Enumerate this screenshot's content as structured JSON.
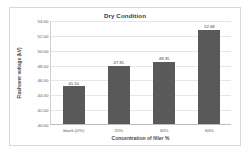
{
  "chart_data": {
    "type": "bar",
    "title": "Dry Condition",
    "xlabel": "Concentration of filler %",
    "ylabel": "Flashover voltage (kV)",
    "categories": [
      "blank (0%)",
      "20%",
      "40%",
      "60%"
    ],
    "values": [
      45.1,
      47.81,
      48.35,
      52.68
    ],
    "value_labels": [
      "45.10",
      "47.81",
      "48.35",
      "52.68"
    ],
    "ylim": [
      40.0,
      54.0
    ],
    "ytick_labels": [
      "54.00",
      "52.00",
      "50.00",
      "48.00",
      "46.00",
      "44.00",
      "42.00",
      "40.00"
    ],
    "yticks": [
      54.0,
      52.0,
      50.0,
      48.0,
      46.0,
      44.0,
      42.0,
      40.0
    ],
    "grid": true,
    "legend": false,
    "series": [
      {
        "name": "Flashover voltage (kV)",
        "values": [
          45.1,
          47.81,
          48.35,
          52.68
        ],
        "color": "#595959"
      }
    ]
  }
}
